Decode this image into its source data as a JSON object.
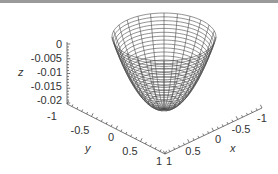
{
  "chart_data": {
    "type": "surface3d",
    "title": "",
    "xlabel": "x",
    "ylabel": "y",
    "zlabel": "z",
    "x_ticks": [
      "1",
      "0.5",
      "0",
      "-0.5",
      "-1"
    ],
    "y_ticks": [
      "-1",
      "-0.5",
      "0",
      "0.5",
      "1"
    ],
    "z_ticks": [
      "0",
      "-0.005",
      "-0.01",
      "-0.015",
      "-0.02"
    ],
    "xlim": [
      -1,
      1
    ],
    "ylim": [
      -1,
      1
    ],
    "zlim": [
      -0.02,
      0
    ],
    "mesh": {
      "radial_lines": 24,
      "rings": 22
    },
    "colors": {
      "mesh": "#4a4a4a",
      "axis": "#555555",
      "background": "#ffffff"
    },
    "grid": false,
    "legend": null
  }
}
